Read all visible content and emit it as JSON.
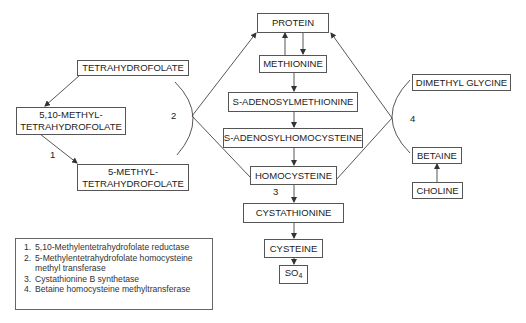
{
  "nodes": {
    "protein": "PROTEIN",
    "methionine": "METHIONINE",
    "sam": "S-ADENOSYLMETHIONINE",
    "sah": "S-ADENOSYLHOMOCYSTEINE",
    "homocysteine": "HOMOCYSTEINE",
    "cystathionine": "CYSTATHIONINE",
    "cysteine": "CYSTEINE",
    "so4": {
      "base": "SO",
      "sub": "4"
    },
    "thf": "TETRAHYDROFOLATE",
    "methylene_thf": {
      "line1": "5,10-METHYL-",
      "line2": "TETRAHYDROFOLATE"
    },
    "methyl_thf": {
      "line1": "5-METHYL-",
      "line2": "TETRAHYDROFOLATE"
    },
    "dimethyl_glycine": "DIMETHYL GLYCINE",
    "betaine": "BETAINE",
    "choline": "CHOLINE"
  },
  "enzyme_labels": {
    "e1": "1",
    "e2": "2",
    "e3": "3",
    "e4": "4"
  },
  "legend": {
    "items": [
      {
        "num": "1.",
        "text": "5,10-Methylentetrahydrofolate reductase"
      },
      {
        "num": "2.",
        "text": "5-Methylentetrahydrofolate homocysteine methyl transferase"
      },
      {
        "num": "3.",
        "text": "Cystathionine B synthetase"
      },
      {
        "num": "4.",
        "text": "Betaine homocysteine methyltransferase"
      }
    ]
  },
  "colors": {
    "line": "#444444",
    "border": "#555555"
  }
}
